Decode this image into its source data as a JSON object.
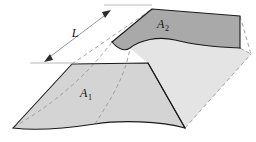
{
  "figure": {
    "background_color": "#ffffff"
  },
  "labels": {
    "area_1": {
      "base": "A",
      "subscript": "1",
      "x": 86,
      "y": 97
    },
    "area_2": {
      "base": "A",
      "subscript": "2",
      "x": 163,
      "y": 28
    },
    "length": {
      "text": "L",
      "x": 75,
      "y": 37
    }
  },
  "colors": {
    "face_a1_fill": "#d4d4d4",
    "face_a2_fill": "#a9a9a9",
    "side_face_fill": "#e4e4e4",
    "far_side_fill": "#ededed",
    "outline": "#1a1a1a",
    "hidden_line": "#9a9a9a",
    "dimension_line": "#8a8a8a",
    "extension_line": "#b0b0b0",
    "arrow_fill": "#2b2b2b",
    "text": "#111111"
  },
  "geometry": {
    "face_a1_path": "M 13 128 L 72 64 L 148 63 L 185 128 C 160 121 120 120 95 124 C 62 129 36 131 13 128 Z",
    "face_a2_path": "M 112 42 L 152 9 L 240 16 L 240 48 C 215 47 195 45 175 40 C 158 36 140 40 130 48 C 124 52 118 49 112 42 Z",
    "side_face_path": "M 148 63 L 185 128 L 251 54 L 240 48 C 215 47 195 45 175 40 C 158 36 140 40 130 48 Z",
    "a1_outline_path": "M 13 128 L 72 64 L 148 63 L 185 128",
    "a1_bottom_wave": "M 13 128 C 36 131 62 129 95 124 C 120 120 160 121 185 128",
    "a2_outline_path": "M 112 42 L 152 9 L 240 16 L 240 48",
    "a2_bottom_wave": "M 112 42 C 118 49 124 52 130 48 C 140 40 158 36 175 40 C 195 45 215 47 240 48",
    "side_edge_path": "M 148 63 L 185 128",
    "hidden_edges": [
      "M 14 127 C 46 108 80 84 112 42",
      "M 72 64 L 152 9",
      "M 185 128 L 251 54",
      "M 240 48 L 251 54",
      "M 240 16 L 251 54",
      "M 95 124 C 110 100 125 78 130 48"
    ]
  },
  "dimension": {
    "arrow_start": {
      "x": 45,
      "y": 61
    },
    "arrow_end": {
      "x": 110,
      "y": 11
    },
    "extension_upper": {
      "x1": 104,
      "y1": 5,
      "x2": 152,
      "y2": 5
    },
    "extension_lower": {
      "x1": 30,
      "y1": 63,
      "x2": 78,
      "y2": 63
    }
  }
}
